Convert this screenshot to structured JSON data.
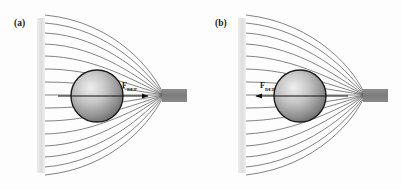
{
  "figure": {
    "background_color": "#fdfdfd",
    "width": 401,
    "height": 189
  },
  "colors": {
    "field_line": "#5a5a5a",
    "sphere_outline": "#1a1a1a",
    "sphere_light": "#e8e8e8",
    "sphere_dark": "#6f6f6f",
    "pin_electrode": "#808080",
    "plate_electrode": "#e2e2e2",
    "arrow": "#111111",
    "text": "#1a1a1a"
  },
  "panels": [
    {
      "id": "a",
      "label": "(a)",
      "label_x": 14,
      "label_y": 26,
      "force": {
        "symbol": "F",
        "subscript": "DEP",
        "label_x": 122,
        "label_y": 88,
        "direction": "right",
        "arrow_x1": 58,
        "arrow_x2": 148,
        "arrow_y": 96,
        "description": "positive DEP - sphere attracted toward high field pin electrode"
      },
      "sphere": {
        "cx": 97,
        "cy": 96,
        "r": 26
      },
      "plate_electrode": {
        "x": 37,
        "y": 18,
        "width": 8,
        "height": 155
      },
      "pin_electrode": {
        "x": 162,
        "y": 89,
        "width": 25,
        "height": 13
      },
      "focus": {
        "x": 164,
        "y": 95
      },
      "field_line_count": 15
    },
    {
      "id": "b",
      "label": "(b)",
      "label_x": 215,
      "label_y": 26,
      "force": {
        "symbol": "F",
        "subscript": "DEP",
        "label_x": 260,
        "label_y": 88,
        "direction": "left",
        "arrow_x1": 348,
        "arrow_x2": 256,
        "arrow_y": 96,
        "description": "negative DEP - sphere repelled away from high field pin electrode"
      },
      "sphere": {
        "cx": 300,
        "cy": 96,
        "r": 26
      },
      "plate_electrode": {
        "x": 238,
        "y": 18,
        "width": 8,
        "height": 155
      },
      "pin_electrode": {
        "x": 363,
        "y": 89,
        "width": 25,
        "height": 13
      },
      "focus": {
        "x": 365,
        "y": 95
      },
      "field_line_count": 15
    }
  ]
}
